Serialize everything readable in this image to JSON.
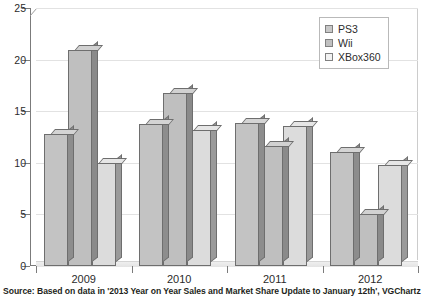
{
  "chart_data": {
    "type": "bar",
    "title": "",
    "subtitle": "",
    "xlabel": "",
    "ylabel": "",
    "categories": [
      "2009",
      "2010",
      "2011",
      "2012"
    ],
    "series": [
      {
        "name": "PS3",
        "values": [
          12.8,
          13.8,
          13.9,
          11.0
        ]
      },
      {
        "name": "Wii",
        "values": [
          20.9,
          16.8,
          11.6,
          5.0
        ]
      },
      {
        "name": "XBox360",
        "values": [
          10.0,
          13.2,
          13.6,
          9.8
        ]
      }
    ],
    "ylim": [
      0,
      25
    ],
    "yticks": [
      0,
      5,
      10,
      15,
      20,
      25
    ],
    "ytick_labels": [
      "0",
      "5",
      "10",
      "15",
      "20",
      "25"
    ],
    "grid": true,
    "legend_position": "top-right",
    "style": "3d-bar"
  },
  "legend": {
    "items": [
      {
        "label": "PS3",
        "color": "#c8c8c8"
      },
      {
        "label": "Wii",
        "color": "#c0c0c0"
      },
      {
        "label": "XBox360",
        "color": "#f2f2f2"
      }
    ]
  },
  "footer": {
    "source": "Source: Based on data in '2013 Year on Year Sales and Market Share Update to January 12th', VGChartz"
  },
  "colors": {
    "axis": "#7b7b7b",
    "grid": "#e2e2e2",
    "text": "#2b2b2b",
    "background": "#ffffff"
  }
}
